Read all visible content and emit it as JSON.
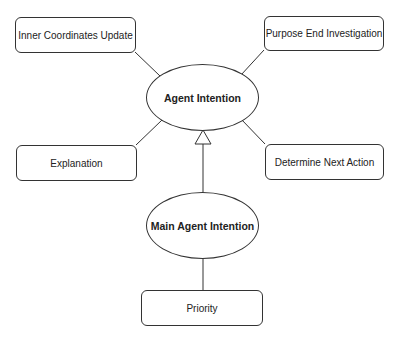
{
  "diagram": {
    "nodes": {
      "agent_intention": {
        "label": "Agent Intention",
        "shape": "ellipse"
      },
      "main_agent_intention": {
        "label": "Main Agent Intention",
        "shape": "ellipse"
      },
      "inner_coordinates_update": {
        "label": "Inner Coordinates Update",
        "shape": "rounded-rect"
      },
      "purpose_end_investigation": {
        "label": "Purpose End Investigation",
        "shape": "rounded-rect"
      },
      "explanation": {
        "label": "Explanation",
        "shape": "rounded-rect"
      },
      "determine_next_action": {
        "label": "Determine Next Action",
        "shape": "rounded-rect"
      },
      "priority": {
        "label": "Priority",
        "shape": "rounded-rect"
      }
    },
    "edges": [
      {
        "from": "inner_coordinates_update",
        "to": "agent_intention",
        "type": "line"
      },
      {
        "from": "purpose_end_investigation",
        "to": "agent_intention",
        "type": "line"
      },
      {
        "from": "explanation",
        "to": "agent_intention",
        "type": "line"
      },
      {
        "from": "determine_next_action",
        "to": "agent_intention",
        "type": "line"
      },
      {
        "from": "main_agent_intention",
        "to": "agent_intention",
        "type": "generalization-arrow"
      },
      {
        "from": "main_agent_intention",
        "to": "priority",
        "type": "line"
      }
    ],
    "colors": {
      "stroke": "#333333",
      "text": "#222222",
      "background": "#ffffff"
    }
  }
}
